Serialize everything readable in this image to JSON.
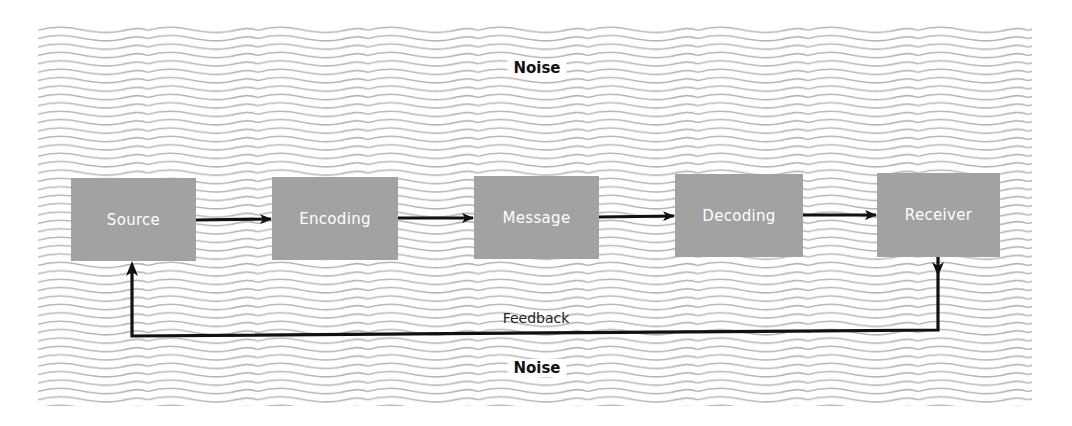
{
  "colors": {
    "background": "#ffffff",
    "noise_wave": "#b4b4b4",
    "node_fill": "#a2a2a2",
    "node_text": "#ffffff",
    "arrow": "#111111",
    "label_text": "#111111"
  },
  "noise": {
    "top_label": "Noise",
    "bottom_label": "Noise"
  },
  "nodes": [
    {
      "id": "source",
      "label": "Source"
    },
    {
      "id": "encoding",
      "label": "Encoding"
    },
    {
      "id": "message",
      "label": "Message"
    },
    {
      "id": "decoding",
      "label": "Decoding"
    },
    {
      "id": "receiver",
      "label": "Receiver"
    }
  ],
  "edges": [
    {
      "from": "source",
      "to": "encoding"
    },
    {
      "from": "encoding",
      "to": "message"
    },
    {
      "from": "message",
      "to": "decoding"
    },
    {
      "from": "decoding",
      "to": "receiver"
    },
    {
      "from": "receiver",
      "to": "source",
      "label": "Feedback"
    }
  ],
  "feedback": {
    "label": "Feedback"
  }
}
